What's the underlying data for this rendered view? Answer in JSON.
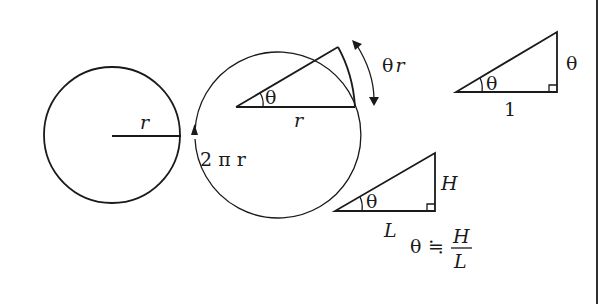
{
  "diagram": {
    "colors": {
      "ink": "#1a1a1a",
      "background": "#ffffff"
    },
    "circle_panel": {
      "radius_label": "r",
      "circumference_label": "2 π r"
    },
    "sector_panel": {
      "angle_label": "θ",
      "radius_label": "r",
      "arc_length_label": "θ r"
    },
    "unit_triangle_panel": {
      "angle_label": "θ",
      "base_label": "1",
      "height_label": "θ"
    },
    "general_triangle_panel": {
      "angle_label": "θ",
      "base_label": "L",
      "height_label": "H",
      "formula": {
        "lhs": "θ",
        "relation": "≒",
        "numerator": "H",
        "denominator": "L"
      }
    }
  }
}
